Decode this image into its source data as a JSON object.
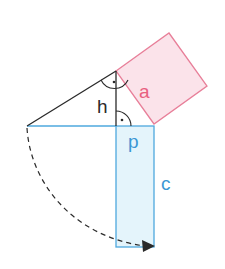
{
  "diagram": {
    "labels": {
      "a": "a",
      "h": "h",
      "p": "p",
      "c": "c"
    },
    "right_angle_mark": "·",
    "colors": {
      "triangle": "#2a2a2a",
      "square_fill": "#fbe3ea",
      "square_stroke": "#e87f99",
      "square_label": "#e8607f",
      "rect_fill": "#e4f4fb",
      "rect_stroke": "#4ea8de",
      "rect_label": "#3a97d4",
      "arc": "#2a2a2a"
    }
  }
}
